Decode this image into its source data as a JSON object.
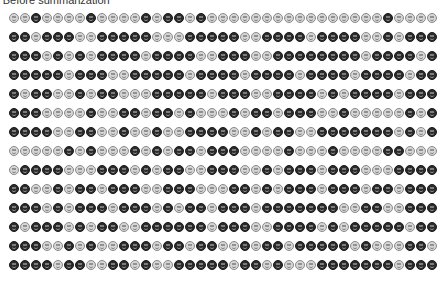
{
  "title": "r Before summarization",
  "legend": {
    "D": "dark-smiley",
    "L": "light-smiley"
  },
  "colors": {
    "dark": "#2b2b2b",
    "light": "#d6d6d6",
    "outline_light": "#8a8a8a"
  },
  "grid": {
    "columns": 39,
    "rows": [
      "LLDLLLLDLLLLDLDDLDLLLLLLLLLLLLLLLLDLLLL",
      "DDLDDDLLDDDDDLLLDDDDDLLDDDDLDDDDLLDLDDD",
      "DDDLDLDLDDDDLDDDDLLDDDLLDDDDDDDDLDDDDLD",
      "DDDDDLDDDLLDDDDDLDDDDLDDDDLDDDDLDDDDLDDDL",
      "DLDDLLDLDDLLLDDDDDLDDDLLDDDDLDLDDDDLDDDL",
      "DDDLLLLDLLDDLDDLDLLLDLDDLDDDLLDLLLLLDLDDD",
      "DDDDLLDDLLDLLDLLDDDDLLDLDDLLDDDDDDDLDLDLL",
      "LLLLLDLDLLLDLDLDDLDDDLLLLDLLLDLLLLDDLLLLDD",
      "LDDDDLLLDDDLDLDDLLDDDLLDLDDDLDDDLLLDDDDLDD",
      "DDLLDLDDLDDDLLDDDLLLDDLDLDDDLDDDLDDLDDDDLL",
      "DDDLDLDDDLDDDLDLDDLDDDLDDDDDDDLLDDLLDDDDL",
      "DLDDDLDLDDLLDDDDDDLDDDLLDDDDLDLDDDDDLDDDDL",
      "DDDLLDLDLLDDDLDDLDDLLDLDDLDDDDDLDLLLDDLDDDD",
      "DDDDLDDLLDDLDLLDDDDDLDDLDLLLDDDDDDDLDDDDLL"
    ]
  }
}
